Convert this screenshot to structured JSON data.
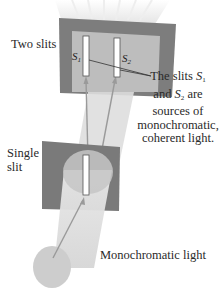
{
  "labels": {
    "two_slits": "Two slits",
    "single_slit_line1": "Single",
    "single_slit_line2": "slit",
    "source": "Monochromatic light",
    "s1": "S",
    "s1_sub": "1",
    "s2": "S",
    "s2_sub": "2"
  },
  "callout": {
    "line1_pre": "The slits ",
    "line1_s": "S",
    "line1_sub": "1",
    "line2_pre": "and ",
    "line2_s": "S",
    "line2_sub": "2",
    "line2_post": " are",
    "line3": "sources of",
    "line4": "monochromatic,",
    "line5": "coherent light."
  },
  "colors": {
    "barrier_dark": "#7a7a7a",
    "barrier_inner": "#b9b9b9",
    "beam": "#dcdcdc",
    "ray": "#a0a0a0",
    "slit": "#ffffff"
  }
}
